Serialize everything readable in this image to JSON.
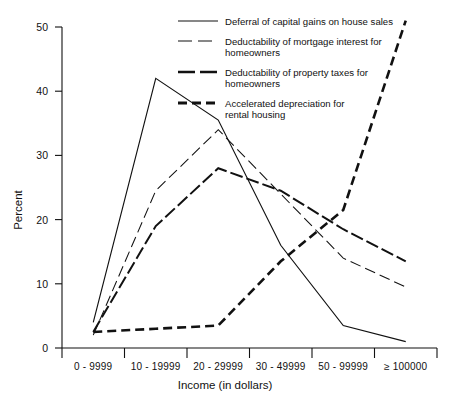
{
  "chart_data": {
    "type": "line",
    "title": "",
    "xlabel": "Income (in dollars)",
    "ylabel": "Percent",
    "categories": [
      "0 - 9999",
      "10 - 19999",
      "20 - 29999",
      "30 - 49999",
      "50 - 99999",
      "≥ 100000"
    ],
    "ylim": [
      0,
      50
    ],
    "yticks": [
      0,
      10,
      20,
      30,
      40,
      50
    ],
    "ytick_labels": [
      "0",
      "10",
      "20",
      "30",
      "40",
      "50"
    ],
    "grid": false,
    "legend_position": "top-right",
    "series": [
      {
        "name": "Deferral of capital gains on house sales",
        "style": "solid",
        "values": [
          4,
          42,
          35.5,
          16,
          3.5,
          1
        ]
      },
      {
        "name": "Deductability of mortgage interest for homeowners",
        "style": "long-dash",
        "values": [
          2,
          24.5,
          34,
          24,
          14,
          9.5
        ]
      },
      {
        "name": "Deductability of property taxes for homeowners",
        "style": "thick-dash",
        "values": [
          2.5,
          19,
          28,
          24.5,
          18.5,
          13.5
        ]
      },
      {
        "name": "Accelerated depreciation for rental housing",
        "style": "bold-dash",
        "values": [
          2.5,
          3,
          3.5,
          13.5,
          21.5,
          51
        ]
      }
    ]
  },
  "legend": {
    "entries": [
      {
        "line1": "Deferral of capital gains on house sales",
        "line2": ""
      },
      {
        "line1": "Deductability of mortgage interest for",
        "line2": "homeowners"
      },
      {
        "line1": "Deductability of property taxes for",
        "line2": "homeowners"
      },
      {
        "line1": "Accelerated depreciation for",
        "line2": "rental housing"
      }
    ]
  },
  "axes": {
    "y_title": "Percent",
    "x_title": "Income (in dollars)",
    "y_labels": [
      "50",
      "40",
      "30",
      "20",
      "10",
      "0"
    ],
    "x_labels": [
      "0 - 9999",
      "10 - 19999",
      "20 - 29999",
      "30 - 49999",
      "50 - 99999",
      "≥ 100000"
    ]
  },
  "colors": {
    "ink": "#111111",
    "background": "#ffffff"
  }
}
